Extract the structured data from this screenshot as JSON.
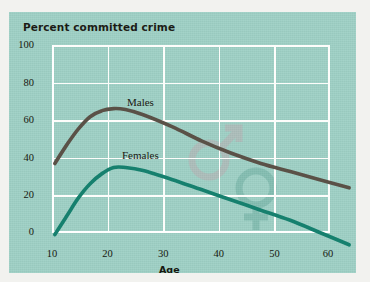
{
  "figure": {
    "title": "Percent committed crime",
    "background_color": "#9ed0c5",
    "grid_color": "#fdfdfb"
  },
  "watermarks": [
    {
      "name": "male-symbol-watermark",
      "glyph": "mars",
      "color": "#c7a3ac"
    },
    {
      "name": "female-symbol-watermark",
      "glyph": "venus",
      "color": "#5fa396"
    }
  ],
  "chart_data": {
    "type": "line",
    "title": "Percent committed crime",
    "xlabel": "Age",
    "ylabel": "Percent committed crime",
    "xlim": [
      10,
      60
    ],
    "ylim": [
      0,
      100
    ],
    "xticks": [
      "10",
      "20",
      "30",
      "40",
      "50",
      "60"
    ],
    "yticks": [
      "0",
      "20",
      "40",
      "60",
      "80",
      "100"
    ],
    "grid": true,
    "legend": "inline-curve-labels",
    "series": [
      {
        "name": "Males",
        "color": "#5a5147",
        "x": [
          10,
          12,
          14,
          16,
          18,
          20,
          22,
          25,
          30,
          35,
          40,
          45,
          50,
          55,
          60
        ],
        "values": [
          43,
          52,
          60,
          66,
          69,
          70,
          69.5,
          67,
          61,
          54,
          48,
          43,
          39,
          35,
          31
        ]
      },
      {
        "name": "Females",
        "color": "#16806e",
        "x": [
          10,
          12,
          14,
          16,
          18,
          20,
          22,
          25,
          30,
          35,
          40,
          45,
          50,
          55,
          60
        ],
        "values": [
          8,
          17,
          26,
          33,
          38,
          41,
          41,
          39.5,
          35,
          30,
          25,
          20,
          15,
          9,
          3
        ]
      }
    ]
  }
}
